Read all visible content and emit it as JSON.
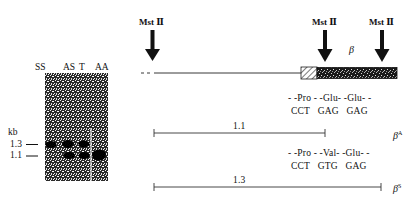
{
  "gel": {
    "lanes": [
      "SS",
      "AS",
      "T",
      "AA"
    ],
    "unit_label": "kb",
    "size_markers": [
      "1.3",
      "1.1"
    ]
  },
  "map": {
    "enzyme_label": "Mst Ⅱ",
    "gene_label": "β",
    "fragment_A": {
      "size": "1.1",
      "amino_acids": "- -Pro - -Glu- -Glu- -",
      "codons": "CCT   GAG   GAG",
      "allele_label": "β",
      "allele_sup": "A"
    },
    "fragment_S": {
      "size": "1.3",
      "amino_acids": "- -Pro - -Val- -Glu- -",
      "codons": "CCT   GTG   GAG",
      "allele_label": "β",
      "allele_sup": "S"
    }
  }
}
